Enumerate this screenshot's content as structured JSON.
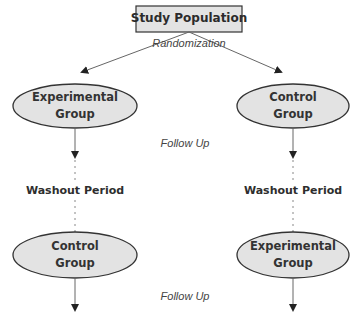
{
  "diagram": {
    "top_box": {
      "label": "Study Population"
    },
    "randomization_label": "Randomization",
    "left_column": {
      "first_group": {
        "line1": "Experimental",
        "line2": "Group"
      },
      "washout_label": "Washout Period",
      "second_group": {
        "line1": "Control",
        "line2": "Group"
      }
    },
    "right_column": {
      "first_group": {
        "line1": "Control",
        "line2": "Group"
      },
      "washout_label": "Washout Period",
      "second_group": {
        "line1": "Experimental",
        "line2": "Group"
      }
    },
    "follow_up_label_1": "Follow Up",
    "follow_up_label_2": "Follow Up",
    "colors": {
      "node_fill": "#e3e3e3",
      "node_stroke": "#333333",
      "line": "#555555"
    }
  }
}
